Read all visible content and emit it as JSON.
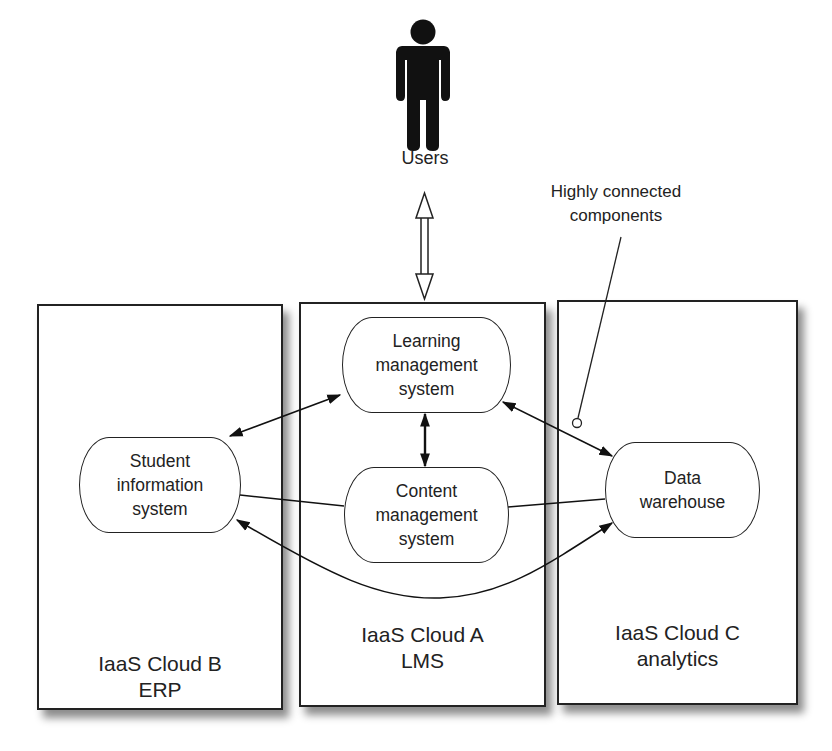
{
  "diagram": {
    "users": {
      "label": "Users",
      "icon": "person-icon"
    },
    "annotation": {
      "line1": "Highly connected",
      "line2": "components"
    },
    "clouds": [
      {
        "id": "cloud-b",
        "title": "IaaS Cloud B",
        "subtitle": "ERP"
      },
      {
        "id": "cloud-a",
        "title": "IaaS Cloud A",
        "subtitle": "LMS"
      },
      {
        "id": "cloud-c",
        "title": "IaaS Cloud C",
        "subtitle": "analytics"
      }
    ],
    "nodes": {
      "sis": {
        "lines": [
          "Student",
          "information",
          "system"
        ]
      },
      "lms": {
        "lines": [
          "Learning",
          "management",
          "system"
        ]
      },
      "cms": {
        "lines": [
          "Content",
          "management",
          "system"
        ]
      },
      "dw": {
        "lines": [
          "Data",
          "warehouse"
        ]
      }
    },
    "edges": [
      {
        "from": "Users",
        "to": "Learning management system",
        "type": "double-arrow-hollow"
      },
      {
        "from": "Learning management system",
        "to": "Student information system",
        "type": "bidirectional"
      },
      {
        "from": "Learning management system",
        "to": "Content management system",
        "type": "bidirectional"
      },
      {
        "from": "Learning management system",
        "to": "Data warehouse",
        "type": "bidirectional"
      },
      {
        "from": "Student information system",
        "to": "Content management system",
        "type": "line"
      },
      {
        "from": "Content management system",
        "to": "Data warehouse",
        "type": "line"
      },
      {
        "from": "Student information system",
        "to": "Data warehouse",
        "type": "bidirectional-curve"
      }
    ]
  }
}
